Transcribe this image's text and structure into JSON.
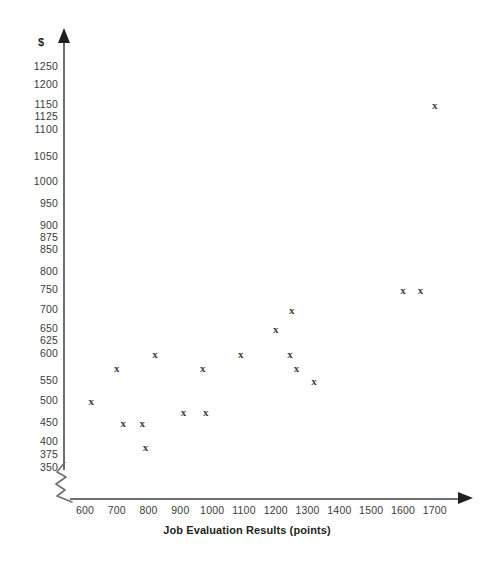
{
  "chart_data": {
    "type": "scatter",
    "title": "",
    "xlabel": "Job Evaluation Results (points)",
    "ylabel": "$",
    "xlim": [
      600,
      1700
    ],
    "ylim": [
      350,
      1250
    ],
    "grid": false,
    "legend": null,
    "marker": "x",
    "x_ticks": [
      600,
      700,
      800,
      900,
      1000,
      1100,
      1200,
      1300,
      1400,
      1500,
      1600,
      1700
    ],
    "x_tick_labels": [
      "600",
      "700",
      "800",
      "900",
      "1000",
      "1100",
      "1200",
      "1300",
      "1400",
      "1500",
      "1600",
      "1700"
    ],
    "y_ticks": [
      350,
      375,
      400,
      450,
      500,
      550,
      600,
      625,
      650,
      700,
      750,
      800,
      850,
      875,
      900,
      950,
      1000,
      1050,
      1100,
      1125,
      1150,
      1200,
      1250
    ],
    "y_tick_labels": [
      "350",
      "375",
      "400",
      "450",
      "500",
      "550",
      "600",
      "625",
      "650",
      "700",
      "750",
      "800",
      "850",
      "875",
      "900",
      "950",
      "1000",
      "1050",
      "1100",
      "1125",
      "1150",
      "1200",
      "1250"
    ],
    "axis_break_x": true,
    "points": [
      {
        "x": 620,
        "y": 500
      },
      {
        "x": 700,
        "y": 575
      },
      {
        "x": 720,
        "y": 450
      },
      {
        "x": 780,
        "y": 450
      },
      {
        "x": 790,
        "y": 390
      },
      {
        "x": 820,
        "y": 600
      },
      {
        "x": 910,
        "y": 475
      },
      {
        "x": 970,
        "y": 575
      },
      {
        "x": 980,
        "y": 475
      },
      {
        "x": 1090,
        "y": 600
      },
      {
        "x": 1200,
        "y": 650
      },
      {
        "x": 1250,
        "y": 700
      },
      {
        "x": 1245,
        "y": 600
      },
      {
        "x": 1265,
        "y": 575
      },
      {
        "x": 1320,
        "y": 550
      },
      {
        "x": 1600,
        "y": 750
      },
      {
        "x": 1655,
        "y": 750
      },
      {
        "x": 1700,
        "y": 1150
      }
    ]
  },
  "axis_geometry": {
    "x_origin_px": 85,
    "x_px_per_100": 31.8,
    "y_label_positions": [
      {
        "value": 1250,
        "px": 67
      },
      {
        "value": 1200,
        "px": 85
      },
      {
        "value": 1150,
        "px": 105
      },
      {
        "value": 1125,
        "px": 117
      },
      {
        "value": 1100,
        "px": 130
      },
      {
        "value": 1050,
        "px": 157
      },
      {
        "value": 1000,
        "px": 182
      },
      {
        "value": 950,
        "px": 204
      },
      {
        "value": 900,
        "px": 226
      },
      {
        "value": 875,
        "px": 238
      },
      {
        "value": 850,
        "px": 250
      },
      {
        "value": 800,
        "px": 272
      },
      {
        "value": 750,
        "px": 290
      },
      {
        "value": 700,
        "px": 310
      },
      {
        "value": 650,
        "px": 329
      },
      {
        "value": 625,
        "px": 341
      },
      {
        "value": 600,
        "px": 354
      },
      {
        "value": 550,
        "px": 381
      },
      {
        "value": 500,
        "px": 401
      },
      {
        "value": 450,
        "px": 423
      },
      {
        "value": 400,
        "px": 442
      },
      {
        "value": 375,
        "px": 455
      },
      {
        "value": 350,
        "px": 468
      }
    ]
  },
  "marker_glyph": "x"
}
